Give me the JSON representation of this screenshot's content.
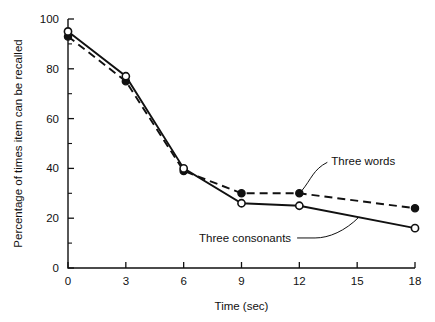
{
  "chart_data": {
    "type": "line",
    "title": "",
    "subtitle": "",
    "xlabel": "Time (sec)",
    "ylabel": "Percentage of times item can be recalled",
    "x": [
      0,
      3,
      6,
      9,
      12,
      18
    ],
    "xlim": [
      0,
      18
    ],
    "ylim": [
      0,
      100
    ],
    "xticks": [
      0,
      3,
      6,
      9,
      12,
      15,
      18
    ],
    "xtick_labels": [
      "0",
      "3",
      "6",
      "9",
      "12",
      "15",
      "18"
    ],
    "yticks": [
      0,
      20,
      40,
      60,
      80,
      100
    ],
    "ytick_labels": [
      "0",
      "20",
      "40",
      "60",
      "80",
      "100"
    ],
    "yticks_minor": [
      10,
      30,
      50,
      70,
      90
    ],
    "grid": false,
    "legend_position": "inline-annotations",
    "series": [
      {
        "name": "Three words",
        "values": [
          93,
          75,
          39,
          30,
          30,
          24
        ],
        "linestyle": "dashed",
        "marker": "filled-circle",
        "color": "#111111"
      },
      {
        "name": "Three consonants",
        "values": [
          95,
          77,
          40,
          26,
          25,
          16
        ],
        "linestyle": "solid",
        "marker": "open-circle",
        "color": "#111111"
      }
    ],
    "annotations": [
      {
        "text": "Three words",
        "points_to_x": 12,
        "points_to_y": 30
      },
      {
        "text": "Three consonants",
        "points_to_x": 15.1,
        "points_to_y": 20.5
      }
    ]
  }
}
